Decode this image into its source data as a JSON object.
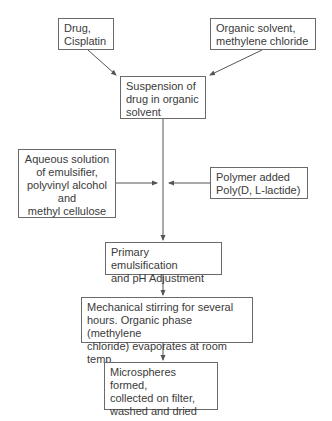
{
  "diagram": {
    "type": "flowchart",
    "nodes": [
      {
        "id": "drug",
        "label": "Drug,\nCisplatin"
      },
      {
        "id": "organic_solvent",
        "label": "Organic solvent,\nmethylene chloride"
      },
      {
        "id": "suspension",
        "label": "Suspension of\ndrug in organic\nsolvent"
      },
      {
        "id": "aqueous",
        "label": "Aqueous solution\nof emulsifier,\npolyvinyl alcohol\nand\nmethyl cellulose"
      },
      {
        "id": "polymer",
        "label": "Polymer added\nPoly(D, L-lactide)"
      },
      {
        "id": "primary_emulsification",
        "label": "Primary emulsification\nand pH Adjustment"
      },
      {
        "id": "stirring",
        "label": "Mechanical stirring for several\nhours. Organic phase (methylene\nchloride) evaporates at room temp."
      },
      {
        "id": "microspheres",
        "label": "Microspheres formed,\ncollected on filter,\nwashed and dried"
      }
    ],
    "edges": [
      {
        "from": "drug",
        "to": "suspension"
      },
      {
        "from": "organic_solvent",
        "to": "suspension"
      },
      {
        "from": "suspension",
        "to": "primary_emulsification"
      },
      {
        "from": "aqueous",
        "to": "suspension-to-primary-line"
      },
      {
        "from": "polymer",
        "to": "suspension-to-primary-line"
      },
      {
        "from": "primary_emulsification",
        "to": "stirring"
      },
      {
        "from": "stirring",
        "to": "microspheres"
      }
    ],
    "colors": {
      "border": "#6a6a6a",
      "text": "#3a3a3a",
      "arrow": "#555555",
      "background": "#ffffff"
    }
  }
}
